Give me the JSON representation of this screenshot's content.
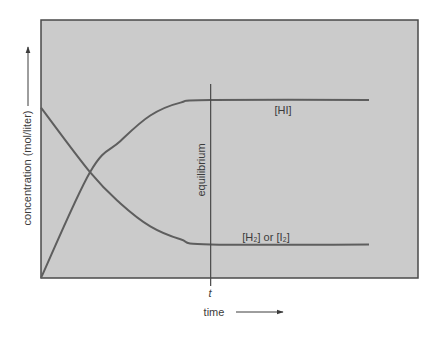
{
  "chart_data": {
    "type": "line",
    "title": "",
    "xlabel": "time",
    "ylabel": "concentration (mol/liter)",
    "x_tick_labels": [
      "t"
    ],
    "annotations": [
      "equilibrium"
    ],
    "grid": false,
    "legend": "inline labels on curves",
    "xlim": [
      0,
      1
    ],
    "ylim": [
      0,
      1
    ],
    "equilibrium_x": 0.45,
    "series": [
      {
        "name": "[HI]",
        "label": "[HI]",
        "points": [
          [
            0,
            0.0
          ],
          [
            0.13,
            0.41
          ],
          [
            0.21,
            0.53
          ],
          [
            0.29,
            0.63
          ],
          [
            0.37,
            0.68
          ],
          [
            0.45,
            0.69
          ],
          [
            0.87,
            0.69
          ]
        ]
      },
      {
        "name": "[H2] or [I2]",
        "label": "[H₂] or [I₂]",
        "points": [
          [
            0,
            0.66
          ],
          [
            0.13,
            0.41
          ],
          [
            0.21,
            0.29
          ],
          [
            0.29,
            0.2
          ],
          [
            0.37,
            0.15
          ],
          [
            0.45,
            0.13
          ],
          [
            0.87,
            0.13
          ]
        ]
      }
    ]
  },
  "colors": {
    "plot_fill": "#cbcbcb",
    "frame": "#4a4a4a",
    "curve": "#5e5e5e",
    "text": "#3c3c3c"
  },
  "labels": {
    "y_axis": "concentration (mol/liter)",
    "x_axis": "time",
    "t_tick": "t",
    "equilibrium": "equilibrium",
    "hi": "[HI]",
    "h2_or_i2": "[H₂] or [I₂]"
  }
}
